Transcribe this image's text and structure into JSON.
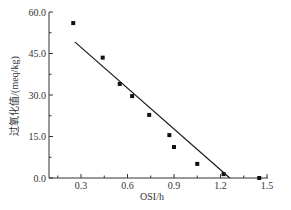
{
  "chart_data": {
    "type": "scatter",
    "title": "",
    "xlabel": "OSI/h",
    "ylabel": "过氧化值/(meq/kg)",
    "xlim": [
      0.1,
      1.55
    ],
    "ylim": [
      0,
      60
    ],
    "x_ticks": [
      0.3,
      0.6,
      0.9,
      1.2,
      1.5
    ],
    "x_tick_labels": [
      "0.3",
      "0.6",
      "0.9",
      "1.2",
      "1.5"
    ],
    "x_minor_ticks": [
      0.15,
      0.45,
      0.75,
      1.05,
      1.35
    ],
    "y_ticks": [
      0,
      15,
      30,
      45,
      60
    ],
    "y_tick_labels": [
      "0.0",
      "15.0",
      "30.0",
      "45.0",
      "60.0"
    ],
    "y_minor_ticks": [
      7.5,
      22.5,
      37.5,
      52.5
    ],
    "grid": false,
    "legend": null,
    "series": [
      {
        "name": "measured",
        "type": "scatter",
        "marker": "square",
        "color": "#111111",
        "x": [
          0.25,
          0.44,
          0.55,
          0.63,
          0.74,
          0.87,
          0.9,
          1.05,
          1.22,
          1.45
        ],
        "y": [
          56.0,
          43.5,
          34.0,
          29.6,
          22.8,
          15.5,
          11.2,
          5.1,
          1.4,
          0.0
        ]
      },
      {
        "name": "linear fit",
        "type": "line",
        "color": "#1a1a1a",
        "x": [
          0.26,
          1.26
        ],
        "y": [
          49.2,
          0.0
        ]
      }
    ]
  },
  "axes": {
    "x_title": "OSI/h",
    "y_title": "过氧化值/(meq/kg)"
  }
}
